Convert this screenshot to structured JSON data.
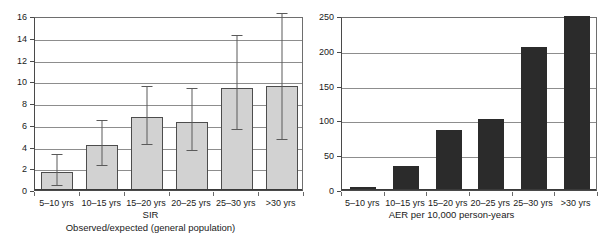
{
  "chart_data": [
    {
      "panel": "left",
      "type": "bar",
      "title": "SIR",
      "subtitle": "Observed/expected (general population)",
      "xlabel": "",
      "ylabel": "",
      "categories": [
        "5–10 yrs",
        "10–15 yrs",
        "15–20 yrs",
        "20–25 yrs",
        "25–30 yrs",
        ">30 yrs"
      ],
      "values": [
        1.7,
        4.15,
        6.75,
        6.25,
        9.35,
        9.6
      ],
      "error_low": [
        0.6,
        2.45,
        4.45,
        3.9,
        5.8,
        4.9
      ],
      "error_high": [
        3.5,
        6.6,
        9.75,
        9.6,
        14.4,
        16.5
      ],
      "ylim": [
        0,
        16
      ],
      "yticks": [
        0,
        2,
        4,
        6,
        8,
        10,
        12,
        14,
        16
      ],
      "ytick_labels": [
        "0",
        "2",
        "4",
        "6",
        "8",
        "10",
        "12",
        "14",
        "16"
      ],
      "grid": true,
      "legend": "none",
      "bar_color": "#d2d2d2",
      "bar_border_color": "#4d4d4d",
      "error_bar_color": "#5a5a5a"
    },
    {
      "panel": "right",
      "type": "bar",
      "title": "AER per 10,000 person-years",
      "subtitle": "",
      "xlabel": "",
      "ylabel": "",
      "categories": [
        "5–10 yrs",
        "10–15 yrs",
        "15–20 yrs",
        "20–25 yrs",
        "25–30 yrs",
        ">30 yrs"
      ],
      "values": [
        5,
        34,
        86,
        102,
        205,
        250
      ],
      "ylim": [
        0,
        250
      ],
      "yticks": [
        0,
        50,
        100,
        150,
        200,
        250
      ],
      "ytick_labels": [
        "0",
        "50",
        "100",
        "150",
        "200",
        "250"
      ],
      "grid": true,
      "legend": "none",
      "bar_color": "#2b2b2b"
    }
  ],
  "left": {
    "caption_title": "SIR",
    "caption_subtitle": "Observed/expected (general population)"
  },
  "right": {
    "caption_title": "AER per 10,000 person-years"
  }
}
